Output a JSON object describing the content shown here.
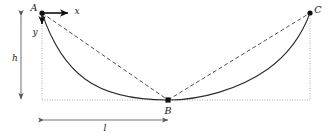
{
  "figure": {
    "background_color": "#ffffff",
    "width": 330,
    "height": 136,
    "points": [
      {
        "id": "A",
        "label": "A",
        "x": 42,
        "y": 13,
        "label_x": 34,
        "label_y": 11
      },
      {
        "id": "B",
        "label": "B",
        "x": 168,
        "y": 100,
        "label_x": 166,
        "label_y": 114
      },
      {
        "id": "C",
        "label": "C",
        "x": 310,
        "y": 13,
        "label_x": 316,
        "label_y": 12
      }
    ],
    "axes": {
      "x_label": "x",
      "x_label_x": 77,
      "x_label_y": 13,
      "y_label": "y",
      "y_label_x": 35,
      "y_label_y": 33,
      "origin_x": 42,
      "origin_y": 13,
      "x_arrow_end": 70,
      "y_arrow_end": 30
    },
    "dimensions": [
      {
        "id": "height",
        "label": "h",
        "orientation": "vertical",
        "x": 21,
        "from": 14,
        "to": 101,
        "label_x": 17,
        "label_y": 60
      },
      {
        "id": "length",
        "label": "l",
        "orientation": "horizontal",
        "y": 120,
        "from": 42,
        "to": 170,
        "label_x": 104,
        "label_y": 130
      }
    ],
    "curve": {
      "type": "cycloid",
      "description": "solid brachistochrone arc from A through B to C",
      "path": "M 42 13 C 50 37, 62 62, 85 79 C 108 96, 140 100, 168 100 C 200 100, 238 90, 268 69 C 290 53, 303 32, 310 13",
      "stroke_color": "#2b2b2b"
    },
    "chords": [
      {
        "id": "A-B",
        "path": "M 42 13 L 168 100",
        "stroke_color": "#3a3a3a"
      },
      {
        "id": "B-C",
        "path": "M 168 100 L 310 13",
        "stroke_color": "#3a3a3a"
      }
    ],
    "guides": [
      {
        "id": "left-vertical",
        "x1": 42,
        "y1": 18,
        "x2": 42,
        "y2": 100
      },
      {
        "id": "right-vertical",
        "x1": 310,
        "y1": 18,
        "x2": 310,
        "y2": 100
      },
      {
        "id": "baseline-horizontal",
        "x1": 42,
        "y1": 100,
        "x2": 310,
        "y2": 100
      }
    ],
    "colors": {
      "curve": "#2b2b2b",
      "chord": "#3a3a3a",
      "guide": "#9a9a9a",
      "dimension": "#555555",
      "text": "#121212"
    }
  }
}
